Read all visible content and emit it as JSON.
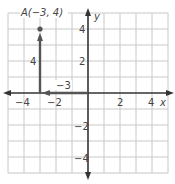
{
  "point": {
    "name": "A",
    "label": "A(−3, 4)",
    "x": -3,
    "y": 4
  },
  "segments": {
    "vertical_label": "4",
    "horizontal_label": "−3"
  },
  "axes": {
    "x_label": "x",
    "y_label": "y",
    "x_ticks": [
      "−4",
      "−2",
      "2",
      "4"
    ],
    "y_ticks": [
      "4",
      "2",
      "−2",
      "−4"
    ],
    "range": [
      -5,
      5
    ]
  },
  "colors": {
    "grid": "#c8c8c8",
    "axis": "#333333",
    "segment": "#555555",
    "text": "#444444"
  }
}
